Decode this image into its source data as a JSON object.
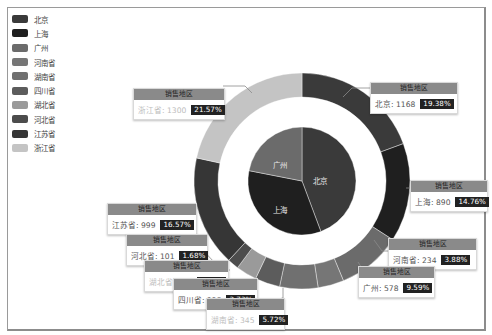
{
  "chart_data": {
    "type": "pie",
    "subtype": "nested-donut",
    "title": "",
    "legend": {
      "position": "top-left",
      "entries": [
        "北京",
        "上海",
        "广州",
        "河南省",
        "湖南省",
        "四川省",
        "湖北省",
        "河北省",
        "江苏省",
        "浙江省"
      ]
    },
    "series": [
      {
        "name": "inner",
        "categories": [
          "北京",
          "上海",
          "广州"
        ],
        "values": [
          1168,
          890,
          578
        ],
        "colors": [
          "#3a3a3a",
          "#1f1f1f",
          "#6b6b6b"
        ]
      },
      {
        "name": "销售地区",
        "categories": [
          "北京",
          "上海",
          "广州",
          "河南省",
          "湖南省",
          "四川省",
          "湖北省",
          "河北省",
          "江苏省",
          "浙江省"
        ],
        "values": [
          1168,
          890,
          578,
          234,
          345,
          225,
          188,
          101,
          999,
          1300
        ],
        "percents": [
          "19.38%",
          "14.76%",
          "9.59%",
          "3.88%",
          "5.72%",
          "3.73%",
          "3.12%",
          "1.68%",
          "16.57%",
          "21.57%"
        ],
        "colors": [
          "#3a3a3a",
          "#1f1f1f",
          "#6b6b6b",
          "#767676",
          "#707070",
          "#5c5c5c",
          "#9a9a9a",
          "#4c4c4c",
          "#363636",
          "#c4c4c4"
        ]
      }
    ]
  },
  "legend": [
    {
      "label": "北京",
      "color": "#3a3a3a"
    },
    {
      "label": "上海",
      "color": "#1f1f1f"
    },
    {
      "label": "广州",
      "color": "#6b6b6b"
    },
    {
      "label": "河南省",
      "color": "#767676"
    },
    {
      "label": "湖南省",
      "color": "#707070"
    },
    {
      "label": "四川省",
      "color": "#5c5c5c"
    },
    {
      "label": "湖北省",
      "color": "#9a9a9a"
    },
    {
      "label": "河北省",
      "color": "#4c4c4c"
    },
    {
      "label": "江苏省",
      "color": "#363636"
    },
    {
      "label": "浙江省",
      "color": "#c4c4c4"
    }
  ],
  "inner_labels": {
    "beijing": "北京",
    "shanghai": "上海",
    "guangzhou": "广州"
  },
  "tooltips": {
    "header": "销售地区",
    "zhejiang": {
      "text": "浙江省: 1300",
      "pct": "21.57%"
    },
    "beijing": {
      "text": "北京: 1168",
      "pct": "19.38%"
    },
    "shanghai": {
      "text": "上海: 890",
      "pct": "14.76%"
    },
    "jiangsu": {
      "text": "江苏省: 999",
      "pct": "16.57%"
    },
    "henan": {
      "text": "河南省: 234",
      "pct": "3.88%"
    },
    "hebei": {
      "text": "河北省: 101",
      "pct": "1.68%"
    },
    "guangzhou": {
      "text": "广州: 578",
      "pct": "9.59%"
    },
    "hubei": {
      "text": "湖北省: 188",
      "pct": "3.12%"
    },
    "sichuan": {
      "text": "四川省: 225",
      "pct": "3.73%"
    },
    "hunan": {
      "text": "湖南省: 345",
      "pct": "5.72%"
    }
  }
}
